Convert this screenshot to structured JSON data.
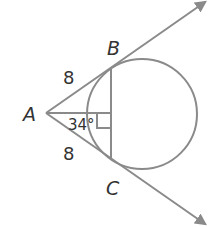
{
  "diagram": {
    "points": {
      "A": "A",
      "B": "B",
      "C": "C"
    },
    "segment_labels": {
      "AB": "8",
      "AC": "8"
    },
    "angle_label": "34°",
    "colors": {
      "stroke": "#8a8a8a",
      "text": "#333333"
    }
  }
}
